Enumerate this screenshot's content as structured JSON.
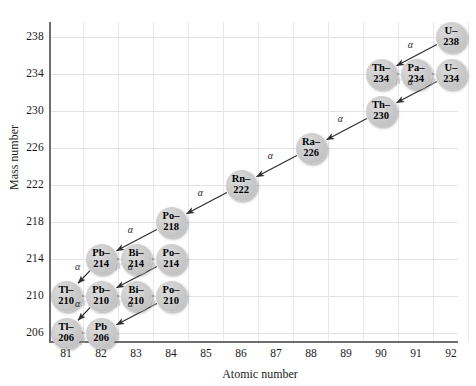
{
  "chart_data": {
    "type": "scatter",
    "title": "",
    "xlabel": "Atomic number",
    "ylabel": "Mass number",
    "xlim": [
      80.5,
      92.5
    ],
    "ylim": [
      204,
      240
    ],
    "xticks": [
      81,
      82,
      83,
      84,
      85,
      86,
      87,
      88,
      89,
      90,
      91,
      92
    ],
    "yticks": [
      206,
      210,
      214,
      218,
      222,
      226,
      230,
      234,
      238
    ],
    "grid": true,
    "legend": null,
    "nodes": [
      {
        "id": "U-238",
        "symbol": "U–",
        "mass": "238",
        "x": 92,
        "y": 238
      },
      {
        "id": "Th-234",
        "symbol": "Th–",
        "mass": "234",
        "x": 90,
        "y": 234
      },
      {
        "id": "Pa-234",
        "symbol": "Pa–",
        "mass": "234",
        "x": 91,
        "y": 234
      },
      {
        "id": "U-234",
        "symbol": "U–",
        "mass": "234",
        "x": 92,
        "y": 234
      },
      {
        "id": "Th-230",
        "symbol": "Th–",
        "mass": "230",
        "x": 90,
        "y": 230
      },
      {
        "id": "Ra-226",
        "symbol": "Ra–",
        "mass": "226",
        "x": 88,
        "y": 226
      },
      {
        "id": "Rn-222",
        "symbol": "Rn–",
        "mass": "222",
        "x": 86,
        "y": 222
      },
      {
        "id": "Po-218",
        "symbol": "Po–",
        "mass": "218",
        "x": 84,
        "y": 218
      },
      {
        "id": "Pb-214",
        "symbol": "Pb–",
        "mass": "214",
        "x": 82,
        "y": 214
      },
      {
        "id": "Bi-214",
        "symbol": "Bi–",
        "mass": "214",
        "x": 83,
        "y": 214
      },
      {
        "id": "Po-214",
        "symbol": "Po–",
        "mass": "214",
        "x": 84,
        "y": 214
      },
      {
        "id": "Tl-210",
        "symbol": "Tl–",
        "mass": "210",
        "x": 81,
        "y": 210
      },
      {
        "id": "Pb-210",
        "symbol": "Pb–",
        "mass": "210",
        "x": 82,
        "y": 210
      },
      {
        "id": "Bi-210",
        "symbol": "Bi–",
        "mass": "210",
        "x": 83,
        "y": 210
      },
      {
        "id": "Po-210",
        "symbol": "Po–",
        "mass": "210",
        "x": 84,
        "y": 210
      },
      {
        "id": "Tl-206",
        "symbol": "Tl–",
        "mass": "206",
        "x": 81,
        "y": 206
      },
      {
        "id": "Pb-206",
        "symbol": "Pb",
        "mass": "206",
        "x": 82,
        "y": 206
      }
    ],
    "decays": [
      {
        "from": "U-238",
        "to": "Th-234",
        "type": "alpha",
        "label": "α"
      },
      {
        "from": "Th-234",
        "to": "Pa-234",
        "type": "beta",
        "label": "β"
      },
      {
        "from": "Pa-234",
        "to": "U-234",
        "type": "beta",
        "label": "β"
      },
      {
        "from": "U-234",
        "to": "Th-230",
        "type": "alpha",
        "label": "α"
      },
      {
        "from": "Th-230",
        "to": "Ra-226",
        "type": "alpha",
        "label": "α"
      },
      {
        "from": "Ra-226",
        "to": "Rn-222",
        "type": "alpha",
        "label": "α"
      },
      {
        "from": "Rn-222",
        "to": "Po-218",
        "type": "alpha",
        "label": "α"
      },
      {
        "from": "Po-218",
        "to": "Pb-214",
        "type": "alpha",
        "label": "α"
      },
      {
        "from": "Pb-214",
        "to": "Bi-214",
        "type": "beta",
        "label": "β"
      },
      {
        "from": "Bi-214",
        "to": "Po-214",
        "type": "beta",
        "label": "β"
      },
      {
        "from": "Po-214",
        "to": "Pb-210",
        "type": "alpha",
        "label": "α"
      },
      {
        "from": "Pb-214",
        "to": "Tl-210",
        "type": "alpha",
        "label": "α"
      },
      {
        "from": "Tl-210",
        "to": "Pb-210",
        "type": "beta",
        "label": "β"
      },
      {
        "from": "Pb-210",
        "to": "Bi-210",
        "type": "beta",
        "label": "β"
      },
      {
        "from": "Bi-210",
        "to": "Po-210",
        "type": "beta",
        "label": "β"
      },
      {
        "from": "Po-210",
        "to": "Pb-206",
        "type": "alpha",
        "label": "α"
      },
      {
        "from": "Pb-210",
        "to": "Tl-206",
        "type": "alpha",
        "label": "α"
      },
      {
        "from": "Tl-206",
        "to": "Pb-206",
        "type": "beta",
        "label": "β"
      }
    ]
  },
  "colors": {
    "node_fill": "#c9c9c9",
    "alpha_arrow": "#2e2e2e",
    "beta_arrow": "#b0b0b0",
    "grid": "#e2e2e6",
    "axis": "#6e6e6e",
    "text": "#1a1a1a"
  }
}
